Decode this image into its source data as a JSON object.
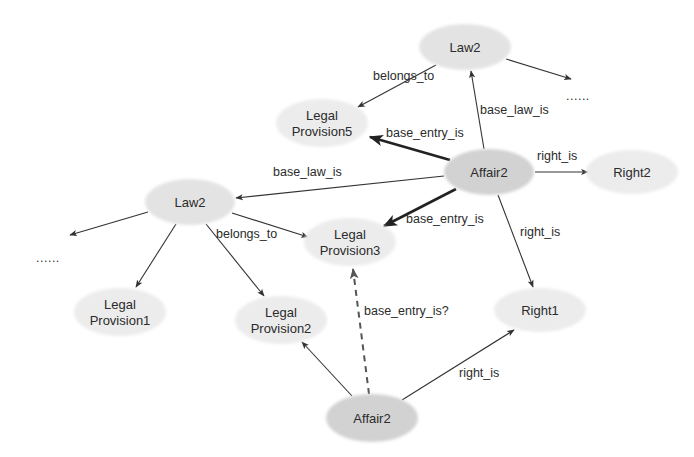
{
  "diagram": {
    "type": "knowledge-graph",
    "colors": {
      "background": "#ffffff",
      "node_fill": "#e3e3e3",
      "node_fill_dark": "#d2d2d2",
      "node_fill_light": "#ececec",
      "edge": "#333333",
      "text": "#2b2b2b"
    },
    "nodes": [
      {
        "id": "law2_top",
        "lines": [
          "Law2"
        ],
        "cx": 465,
        "cy": 47,
        "rx": 46,
        "ry": 23,
        "tone": "mid"
      },
      {
        "id": "provision5",
        "lines": [
          "Legal",
          "Provision5"
        ],
        "cx": 322,
        "cy": 123,
        "rx": 46,
        "ry": 24,
        "tone": "light"
      },
      {
        "id": "affair2_center",
        "lines": [
          "Affair2"
        ],
        "cx": 489,
        "cy": 172,
        "rx": 45,
        "ry": 23,
        "tone": "dark"
      },
      {
        "id": "right2",
        "lines": [
          "Right2"
        ],
        "cx": 632,
        "cy": 172,
        "rx": 46,
        "ry": 22,
        "tone": "light"
      },
      {
        "id": "law2_left",
        "lines": [
          "Law2"
        ],
        "cx": 190,
        "cy": 202,
        "rx": 45,
        "ry": 23,
        "tone": "mid"
      },
      {
        "id": "provision3",
        "lines": [
          "Legal",
          "Provision3"
        ],
        "cx": 350,
        "cy": 242,
        "rx": 46,
        "ry": 24,
        "tone": "light"
      },
      {
        "id": "provision1",
        "lines": [
          "Legal",
          "Provision1"
        ],
        "cx": 120,
        "cy": 312,
        "rx": 46,
        "ry": 24,
        "tone": "light"
      },
      {
        "id": "provision2",
        "lines": [
          "Legal",
          "Provision2"
        ],
        "cx": 281,
        "cy": 320,
        "rx": 46,
        "ry": 24,
        "tone": "light"
      },
      {
        "id": "right1",
        "lines": [
          "Right1"
        ],
        "cx": 540,
        "cy": 310,
        "rx": 46,
        "ry": 22,
        "tone": "light"
      },
      {
        "id": "affair2_bottom",
        "lines": [
          "Affair2"
        ],
        "cx": 372,
        "cy": 418,
        "rx": 46,
        "ry": 24,
        "tone": "dark"
      }
    ],
    "edges": [
      {
        "id": "e1",
        "from": "law2_top",
        "to": "provision5",
        "label": "belongs_to",
        "x1": 436,
        "y1": 65,
        "x2": 358,
        "y2": 107,
        "lx": 373,
        "ly": 80,
        "style": "normal"
      },
      {
        "id": "e2",
        "from": "law2_top",
        "to": "ellipsis_top",
        "label": "",
        "x1": 506,
        "y1": 59,
        "x2": 571,
        "y2": 79,
        "style": "normal"
      },
      {
        "id": "e3",
        "from": "affair2_center",
        "to": "law2_top",
        "label": "base_law_is",
        "x1": 484,
        "y1": 149,
        "x2": 471,
        "y2": 71,
        "lx": 480,
        "ly": 114,
        "style": "normal"
      },
      {
        "id": "e4",
        "from": "affair2_center",
        "to": "provision5",
        "label": "base_entry_is",
        "x1": 450,
        "y1": 160,
        "x2": 370,
        "y2": 137,
        "lx": 386,
        "ly": 137,
        "style": "bold"
      },
      {
        "id": "e5",
        "from": "affair2_center",
        "to": "right2",
        "label": "right_is",
        "x1": 535,
        "y1": 172,
        "x2": 588,
        "y2": 172,
        "lx": 537,
        "ly": 160,
        "style": "normal"
      },
      {
        "id": "e6",
        "from": "affair2_center",
        "to": "law2_left",
        "label": "base_law_is",
        "x1": 444,
        "y1": 176,
        "x2": 236,
        "y2": 198,
        "lx": 273,
        "ly": 176,
        "style": "normal"
      },
      {
        "id": "e7",
        "from": "affair2_center",
        "to": "provision3",
        "label": "base_entry_is",
        "x1": 456,
        "y1": 189,
        "x2": 384,
        "y2": 226,
        "lx": 406,
        "ly": 223,
        "style": "bold"
      },
      {
        "id": "e8",
        "from": "affair2_center",
        "to": "right1",
        "label": "right_is",
        "x1": 498,
        "y1": 195,
        "x2": 533,
        "y2": 287,
        "lx": 520,
        "ly": 236,
        "style": "normal"
      },
      {
        "id": "e9",
        "from": "law2_left",
        "to": "provision3",
        "label": "belongs_to",
        "x1": 232,
        "y1": 213,
        "x2": 308,
        "y2": 237,
        "lx": 216,
        "ly": 238,
        "style": "normal"
      },
      {
        "id": "e10",
        "from": "law2_left",
        "to": "ellipsis_left",
        "label": "",
        "x1": 148,
        "y1": 212,
        "x2": 70,
        "y2": 235,
        "style": "normal"
      },
      {
        "id": "e11",
        "from": "law2_left",
        "to": "provision1",
        "label": "",
        "x1": 176,
        "y1": 224,
        "x2": 136,
        "y2": 287,
        "style": "normal"
      },
      {
        "id": "e12",
        "from": "law2_left",
        "to": "provision2",
        "label": "",
        "x1": 206,
        "y1": 224,
        "x2": 264,
        "y2": 296,
        "style": "normal"
      },
      {
        "id": "e13",
        "from": "affair2_bottom",
        "to": "provision2",
        "label": "",
        "x1": 352,
        "y1": 396,
        "x2": 302,
        "y2": 342,
        "style": "normal"
      },
      {
        "id": "e14",
        "from": "affair2_bottom",
        "to": "provision3",
        "label": "base_entry_is?",
        "x1": 369,
        "y1": 394,
        "x2": 353,
        "y2": 269,
        "lx": 364,
        "ly": 315,
        "style": "dashed"
      },
      {
        "id": "e15",
        "from": "affair2_bottom",
        "to": "right1",
        "label": "right_is",
        "x1": 402,
        "y1": 400,
        "x2": 514,
        "y2": 330,
        "lx": 459,
        "ly": 377,
        "style": "normal"
      }
    ],
    "ellipses": [
      {
        "id": "ellipsis_top",
        "text": "......",
        "x": 566,
        "y": 100
      },
      {
        "id": "ellipsis_left",
        "text": "......",
        "x": 36,
        "y": 262
      }
    ]
  }
}
